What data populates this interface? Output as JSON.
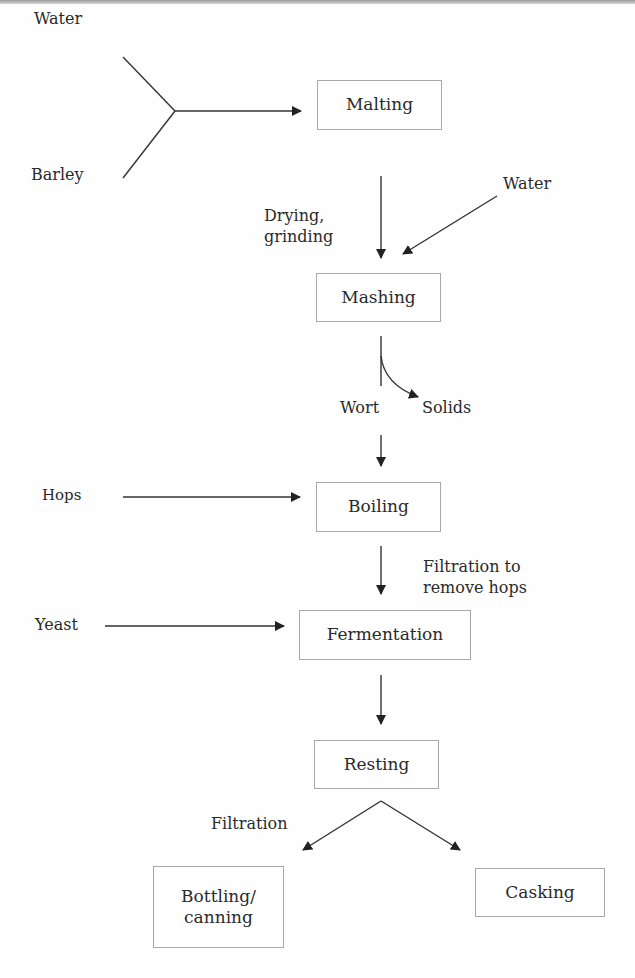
{
  "diagram": {
    "type": "flowchart",
    "process_steps": [
      {
        "id": "malting",
        "label": "Malting"
      },
      {
        "id": "mashing",
        "label": "Mashing"
      },
      {
        "id": "boiling",
        "label": "Boiling"
      },
      {
        "id": "fermentation",
        "label": "Fermentation"
      },
      {
        "id": "resting",
        "label": "Resting"
      },
      {
        "id": "bottling",
        "label": "Bottling/\ncanning",
        "line1": "Bottling/",
        "line2": "canning"
      },
      {
        "id": "casking",
        "label": "Casking"
      }
    ],
    "inputs": {
      "water_1": "Water",
      "barley": "Barley",
      "water_2": "Water",
      "hops": "Hops",
      "yeast": "Yeast"
    },
    "annotations": {
      "drying_line1": "Drying,",
      "drying_line2": "grinding",
      "wort": "Wort",
      "solids": "Solids",
      "filtration_hops_line1": "Filtration to",
      "filtration_hops_line2": "remove hops",
      "filtration": "Filtration"
    },
    "edges": [
      {
        "from": "Water + Barley",
        "to": "Malting"
      },
      {
        "from": "Malting",
        "to": "Mashing",
        "label": "Drying, grinding"
      },
      {
        "from": "Water",
        "to": "Mashing"
      },
      {
        "from": "Mashing",
        "to": "Solids",
        "label": "Wort / Solids"
      },
      {
        "from": "Mashing (Wort)",
        "to": "Boiling"
      },
      {
        "from": "Hops",
        "to": "Boiling"
      },
      {
        "from": "Boiling",
        "to": "Fermentation",
        "label": "Filtration to remove hops"
      },
      {
        "from": "Yeast",
        "to": "Fermentation"
      },
      {
        "from": "Fermentation",
        "to": "Resting"
      },
      {
        "from": "Resting",
        "to": "Bottling/canning",
        "label": "Filtration"
      },
      {
        "from": "Resting",
        "to": "Casking"
      }
    ]
  }
}
